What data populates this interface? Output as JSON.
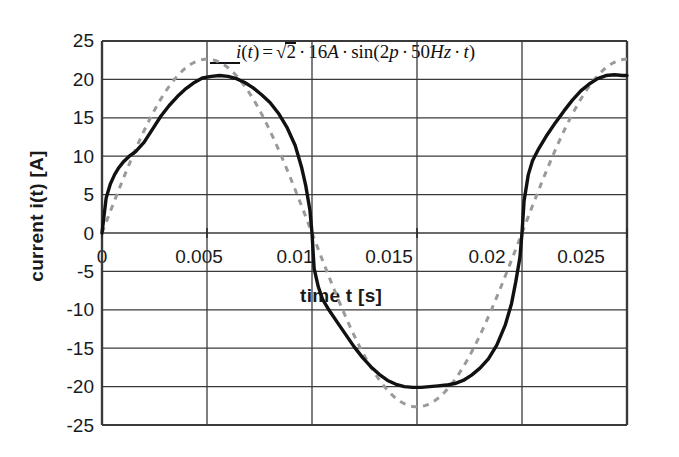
{
  "chart_data": {
    "type": "line",
    "title": "",
    "xlabel": "time  t  [s]",
    "ylabel": "current  i(t)  [A]",
    "xlim": [
      0,
      0.025
    ],
    "ylim": [
      -25,
      25
    ],
    "xticks": [
      "0",
      "0.005",
      "0.01",
      "0.015",
      "0.02",
      "0.025"
    ],
    "xtick_values": [
      0,
      0.005,
      0.01,
      0.015,
      0.02,
      0.025
    ],
    "yticks": [
      "25",
      "20",
      "15",
      "10",
      "5",
      "0",
      "-5",
      "-10",
      "-15",
      "-20",
      "-25"
    ],
    "ytick_values": [
      25,
      20,
      15,
      10,
      5,
      0,
      -5,
      -10,
      -15,
      -20,
      -25
    ],
    "grid": true,
    "legend_position": "inside-top-center",
    "annotation": "i(t) = √2 · 16A · sin(2p · 50Hz · t)",
    "series": [
      {
        "name": "measured current i(t)",
        "style": "solid",
        "color": "#111111",
        "x": [
          0.0,
          0.0002,
          0.0004,
          0.0006,
          0.0008,
          0.001,
          0.0013,
          0.0016,
          0.002,
          0.0024,
          0.0028,
          0.0032,
          0.0036,
          0.004,
          0.0044,
          0.0048,
          0.0052,
          0.0056,
          0.006,
          0.0064,
          0.0068,
          0.0072,
          0.0076,
          0.008,
          0.0084,
          0.0088,
          0.0092,
          0.0095,
          0.0097,
          0.0099,
          0.01,
          0.0101,
          0.0103,
          0.0105,
          0.0108,
          0.0112,
          0.0116,
          0.012,
          0.0124,
          0.0128,
          0.0132,
          0.0136,
          0.014,
          0.0144,
          0.0148,
          0.0152,
          0.0156,
          0.016,
          0.0164,
          0.0168,
          0.0172,
          0.0176,
          0.018,
          0.0184,
          0.0188,
          0.0192,
          0.0195,
          0.0197,
          0.0199,
          0.02,
          0.0201,
          0.0203,
          0.0205,
          0.0208,
          0.0212,
          0.0216,
          0.022,
          0.0224,
          0.0228,
          0.0232,
          0.0236,
          0.024,
          0.0244,
          0.0248,
          0.025
        ],
        "y": [
          0.0,
          4.6,
          6.4,
          7.6,
          8.5,
          9.2,
          10.0,
          10.6,
          11.8,
          13.5,
          15.2,
          16.6,
          17.8,
          18.8,
          19.6,
          20.2,
          20.4,
          20.5,
          20.4,
          20.1,
          19.6,
          18.9,
          18.0,
          17.0,
          15.6,
          13.8,
          11.4,
          8.6,
          6.2,
          3.0,
          0.0,
          -4.6,
          -7.0,
          -8.6,
          -10.0,
          -11.6,
          -13.2,
          -14.8,
          -16.2,
          -17.4,
          -18.4,
          -19.2,
          -19.7,
          -20.0,
          -20.1,
          -20.1,
          -20.0,
          -19.9,
          -19.8,
          -19.6,
          -19.2,
          -18.5,
          -17.6,
          -16.4,
          -14.6,
          -12.0,
          -9.2,
          -6.4,
          -3.2,
          0.0,
          4.2,
          7.6,
          9.4,
          11.0,
          12.8,
          14.4,
          15.9,
          17.3,
          18.5,
          19.4,
          20.1,
          20.5,
          20.6,
          20.5,
          20.5
        ]
      },
      {
        "name": "ideal sinusoid √2·16A·sin(2π·50Hz·t)",
        "style": "dashed",
        "color": "#9a9a9a",
        "amplitude": 22.63,
        "frequency_hz": 50,
        "rms": 16
      }
    ]
  },
  "axes": {
    "x_title": "time   t   [s]",
    "y_title": "current  i(t)  [A]"
  },
  "formula": {
    "lhs_i": "i",
    "lhs_paren_open": "(",
    "lhs_t": "t",
    "lhs_paren_close": ")",
    "equals": "=",
    "radical": "√",
    "two": "2",
    "dot1": "·",
    "sixteen": "16",
    "amp_unit": "A",
    "dot2": "·",
    "sin": "sin",
    "open": "(",
    "two2": "2",
    "pi": "p",
    "dot3": "·",
    "fifty": "50",
    "hz": "Hz",
    "dot4": "·",
    "t2": "t",
    "close": ")"
  }
}
